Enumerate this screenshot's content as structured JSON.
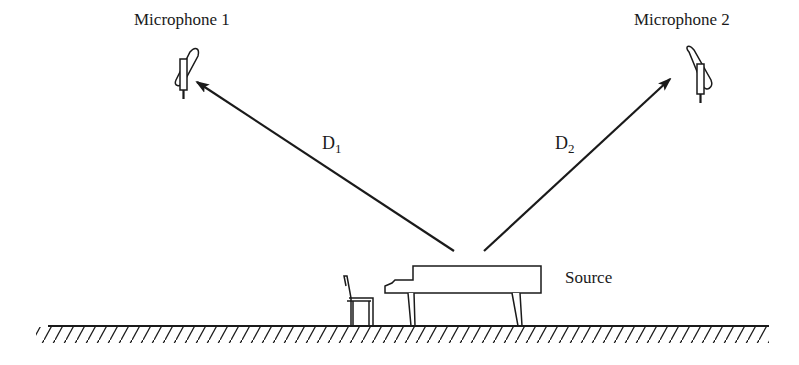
{
  "diagram": {
    "type": "spaced microphone pair recording setup",
    "microphones": [
      {
        "label": "Microphone 1",
        "position": "upper-left"
      },
      {
        "label": "Microphone 2",
        "position": "upper-right"
      }
    ],
    "distances": [
      {
        "symbol": "D",
        "subscript": "1",
        "from": "Source",
        "to": "Microphone 1"
      },
      {
        "symbol": "D",
        "subscript": "2",
        "from": "Source",
        "to": "Microphone 2"
      }
    ],
    "source": {
      "label": "Source",
      "depiction": "grand piano with bench"
    },
    "ground": "hatched floor line",
    "colors": {
      "ink": "#1a1a1a",
      "background": "#ffffff"
    }
  }
}
